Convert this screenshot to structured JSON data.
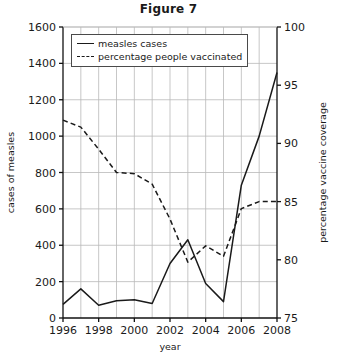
{
  "chart_data": {
    "type": "line",
    "title": "Figure 7",
    "xlabel": "year",
    "ylabel": "cases of measles",
    "y2label": "percentage vaccine coverage",
    "xlim": [
      1996,
      2008
    ],
    "ylim": [
      0,
      1600
    ],
    "y2lim": [
      75,
      100
    ],
    "xticks": [
      1996,
      1998,
      2000,
      2002,
      2004,
      2006,
      2008
    ],
    "xtick_labels": [
      "1996",
      "1998",
      "2000",
      "2002",
      "2004",
      "2006",
      "2008"
    ],
    "yticks": [
      0,
      200,
      400,
      600,
      800,
      1000,
      1200,
      1400,
      1600
    ],
    "ytick_labels": [
      "0",
      "200",
      "400",
      "600",
      "800",
      "1000",
      "1200",
      "1400",
      "1600"
    ],
    "y2ticks": [
      75,
      80,
      85,
      90,
      95,
      100
    ],
    "y2tick_labels": [
      "75",
      "80",
      "85",
      "90",
      "95",
      "100"
    ],
    "grid": true,
    "legend_position": "top-left-inside",
    "x": [
      1996,
      1997,
      1998,
      1999,
      2000,
      2001,
      2002,
      2003,
      2004,
      2005,
      2006,
      2007,
      2008
    ],
    "series": [
      {
        "name": "measles cases",
        "axis": "left",
        "style": "solid",
        "values": [
          75,
          160,
          70,
          95,
          100,
          80,
          300,
          430,
          190,
          90,
          730,
          1000,
          1350
        ]
      },
      {
        "name": "percentage people vaccinated",
        "axis": "right",
        "style": "dashed",
        "values": [
          92,
          91.4,
          89.5,
          87.5,
          87.4,
          86.5,
          83.5,
          79.8,
          81.2,
          80.3,
          84.4,
          85,
          85
        ]
      }
    ]
  },
  "legend": {
    "entries": [
      {
        "label": "measles cases",
        "style": "solid"
      },
      {
        "label": "percentage people vaccinated",
        "style": "dashed"
      }
    ]
  }
}
